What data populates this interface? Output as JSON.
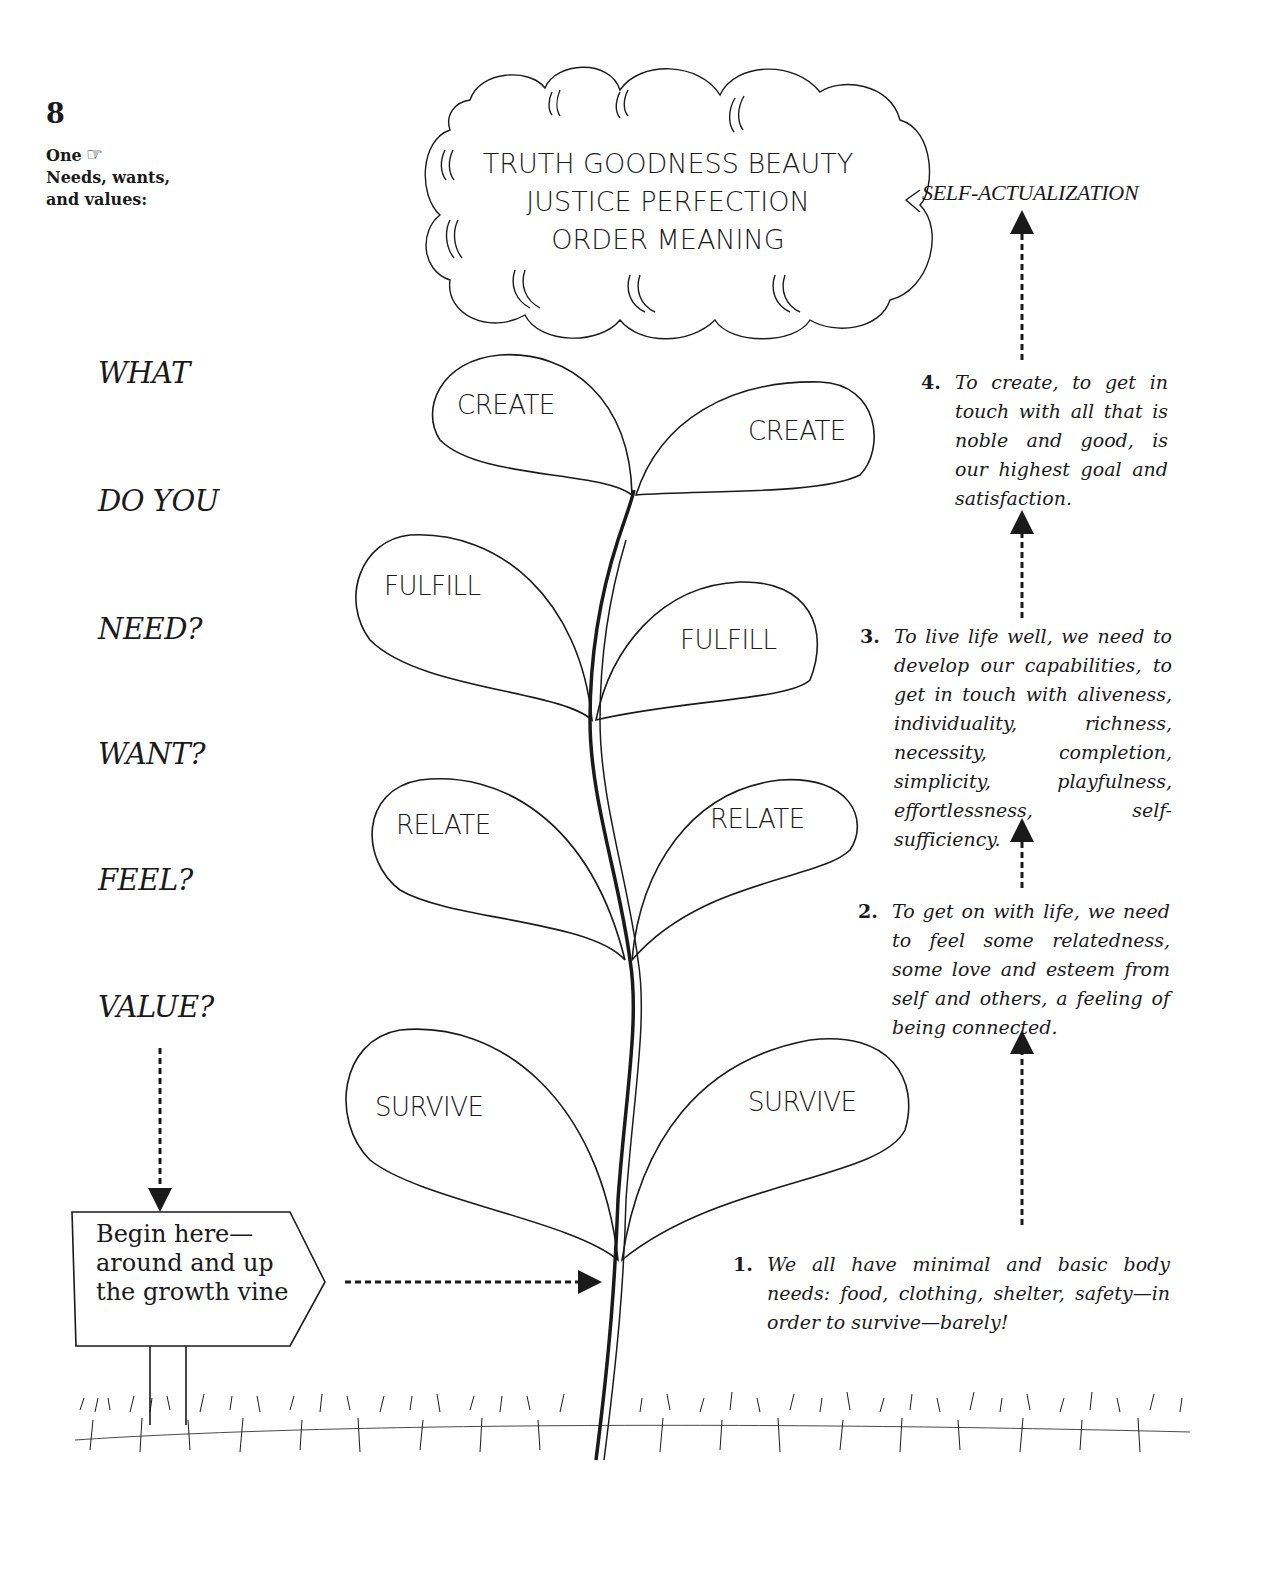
{
  "header": {
    "page_number": "8",
    "section_title_line1": "One",
    "pointing_hand_icon": "☞",
    "section_title_line2": "Needs, wants,",
    "section_title_line3": "and values:"
  },
  "questions": [
    "WHAT",
    "DO YOU",
    "NEED?",
    "WANT?",
    "FEEL?",
    "VALUE?"
  ],
  "cloud": {
    "lines": [
      "TRUTH GOODNESS BEAUTY",
      "JUSTICE PERFECTION",
      "ORDER MEANING"
    ]
  },
  "top_label": "SELF-ACTUALIZATION",
  "leaves": {
    "create_left": "CREATE",
    "create_right": "CREATE",
    "fulfill_left": "FULFILL",
    "fulfill_right": "FULFILL",
    "relate_left": "RELATE",
    "relate_right": "RELATE",
    "survive_left": "SURVIVE",
    "survive_right": "SURVIVE"
  },
  "levels": [
    {
      "number": "1.",
      "text": "We all have minimal and basic body needs: food, clothing, shelter, safety—in order to survive—barely!"
    },
    {
      "number": "2.",
      "text": "To get on with life, we need to feel some relatedness, some love and esteem from self and others, a feeling of being connected."
    },
    {
      "number": "3.",
      "text": "To live life well, we need to develop our capabilities, to get in touch with aliveness, individuality, richness, necessity, completion, simplicity, playfulness, effortlessness, self-sufficiency."
    },
    {
      "number": "4.",
      "text": "To create, to get in touch with all that is noble and good, is our highest goal and satisfaction."
    }
  ],
  "sign": {
    "text": "Begin here— around and up the growth vine"
  },
  "colors": {
    "ink": "#1a1a1a",
    "paper": "#ffffff"
  }
}
